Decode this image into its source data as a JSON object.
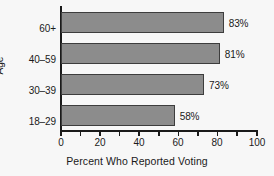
{
  "chart_data": {
    "type": "bar",
    "orientation": "horizontal",
    "title": "",
    "xlabel": "Percent Who Reported Voting",
    "ylabel": "Age",
    "categories": [
      "18–29",
      "30–39",
      "40–59",
      "60+"
    ],
    "values": [
      58,
      73,
      81,
      83
    ],
    "data_labels": [
      "58%",
      "73%",
      "81%",
      "83%"
    ],
    "xlim": [
      0,
      100
    ],
    "xticks": [
      0,
      10,
      20,
      30,
      40,
      50,
      60,
      70,
      80,
      90,
      100
    ],
    "xtick_labels": [
      "0",
      "",
      "20",
      "",
      "40",
      "",
      "60",
      "",
      "80",
      "",
      "100"
    ],
    "grid": false,
    "legend": false,
    "bar_color": "#8c8c8c",
    "bar_edge_color": "#3d3d3d",
    "background_color": "#f7f7f7",
    "text_color": "#1a1a1a",
    "bars": [
      {
        "category": "60+",
        "value": 83,
        "label": "83%"
      },
      {
        "category": "40–59",
        "value": 81,
        "label": "81%"
      },
      {
        "category": "30–39",
        "value": 73,
        "label": "73%"
      },
      {
        "category": "18–29",
        "value": 58,
        "label": "58%"
      }
    ]
  }
}
